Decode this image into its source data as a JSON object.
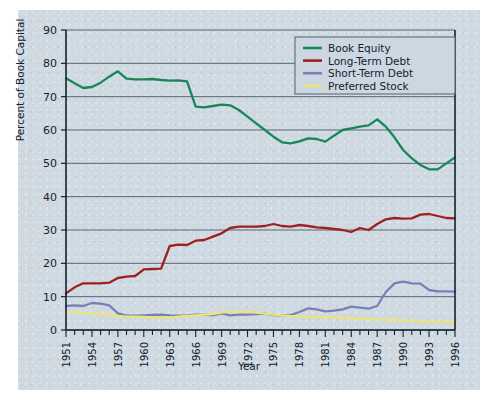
{
  "chart_data": {
    "type": "line",
    "title": "",
    "xlabel": "Year",
    "ylabel": "Percent of Book Capital",
    "xlim": [
      1951,
      1996
    ],
    "ylim": [
      0,
      90
    ],
    "ytick_step": 10,
    "yticks": [
      0,
      10,
      20,
      30,
      40,
      50,
      60,
      70,
      80,
      90
    ],
    "xticks_labeled": [
      1951,
      1954,
      1957,
      1960,
      1963,
      1966,
      1969,
      1972,
      1975,
      1978,
      1981,
      1984,
      1987,
      1990,
      1993,
      1996
    ],
    "xtick_minor_every": 1,
    "grid": "horizontal",
    "legend_position": "top-right",
    "x": [
      1951,
      1952,
      1953,
      1954,
      1955,
      1956,
      1957,
      1958,
      1959,
      1960,
      1961,
      1962,
      1963,
      1964,
      1965,
      1966,
      1967,
      1968,
      1969,
      1970,
      1971,
      1972,
      1973,
      1974,
      1975,
      1976,
      1977,
      1978,
      1979,
      1980,
      1981,
      1982,
      1983,
      1984,
      1985,
      1986,
      1987,
      1988,
      1989,
      1990,
      1991,
      1992,
      1993,
      1994,
      1995,
      1996
    ],
    "series": [
      {
        "name": "Book Equity",
        "color": "#17875a",
        "values": [
          75.5,
          74.0,
          72.6,
          72.9,
          74.2,
          76.0,
          77.6,
          75.4,
          75.2,
          75.2,
          75.3,
          75.0,
          74.8,
          74.9,
          74.6,
          67.0,
          66.8,
          67.2,
          67.6,
          67.4,
          66.0,
          64.0,
          62.0,
          60.0,
          58.0,
          56.3,
          56.0,
          56.6,
          57.5,
          57.3,
          56.5,
          58.3,
          60.0,
          60.5,
          61.0,
          61.4,
          63.2,
          61.0,
          57.8,
          54.0,
          51.5,
          49.5,
          48.2,
          48.2,
          50.0,
          51.8
        ]
      },
      {
        "name": "Long-Term Debt",
        "color": "#a02020",
        "values": [
          11.0,
          12.8,
          14.0,
          14.0,
          14.0,
          14.2,
          15.6,
          16.0,
          16.2,
          18.2,
          18.3,
          18.4,
          25.2,
          25.6,
          25.5,
          26.8,
          27.0,
          28.0,
          29.0,
          30.6,
          31.0,
          31.0,
          31.0,
          31.2,
          31.8,
          31.2,
          31.0,
          31.5,
          31.2,
          30.8,
          30.6,
          30.3,
          30.0,
          29.4,
          30.6,
          30.0,
          31.8,
          33.2,
          33.6,
          33.4,
          33.5,
          34.6,
          34.8,
          34.2,
          33.6,
          33.5
        ]
      },
      {
        "name": "Short-Term Debt",
        "color": "#7b7fb5",
        "values": [
          7.2,
          7.4,
          7.2,
          8.1,
          7.9,
          7.4,
          5.0,
          4.3,
          4.3,
          4.4,
          4.5,
          4.6,
          4.4,
          4.3,
          4.4,
          4.6,
          4.6,
          4.4,
          5.0,
          4.4,
          4.6,
          4.6,
          4.8,
          4.9,
          4.5,
          4.4,
          4.5,
          5.4,
          6.5,
          6.2,
          5.6,
          5.8,
          6.2,
          7.0,
          6.7,
          6.4,
          7.2,
          11.4,
          14.0,
          14.5,
          14.0,
          13.9,
          12.0,
          11.6,
          11.6,
          11.5
        ]
      },
      {
        "name": "Preferred Stock",
        "color": "#ebe47a",
        "values": [
          5.6,
          5.4,
          5.2,
          5.0,
          4.8,
          4.6,
          4.2,
          4.0,
          4.0,
          3.9,
          3.8,
          3.8,
          3.8,
          4.0,
          4.2,
          4.4,
          4.6,
          4.8,
          5.2,
          5.5,
          5.6,
          5.4,
          5.2,
          4.9,
          4.6,
          4.4,
          4.2,
          4.1,
          4.0,
          3.9,
          3.8,
          3.7,
          3.6,
          3.5,
          3.4,
          3.3,
          3.2,
          3.1,
          3.0,
          2.9,
          2.8,
          2.7,
          2.6,
          2.5,
          2.4,
          2.3
        ]
      }
    ]
  },
  "legend": {
    "items": [
      {
        "label": "Book Equity"
      },
      {
        "label": "Long-Term Debt"
      },
      {
        "label": "Short-Term Debt"
      },
      {
        "label": "Preferred Stock"
      }
    ]
  },
  "axes": {
    "y_title": "Percent of Book Capital",
    "x_title": "Year"
  }
}
